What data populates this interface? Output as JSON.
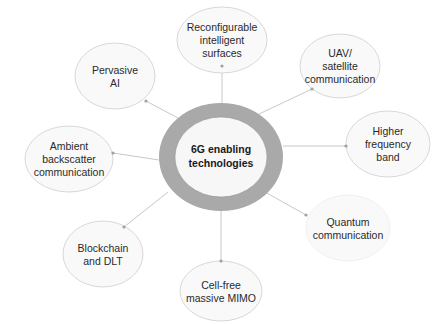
{
  "diagram": {
    "type": "mind-map",
    "center": {
      "lines": [
        "6G enabling",
        "technologies"
      ],
      "ring_color": "#a9a9a9",
      "fill_color": "#f7f7f7"
    },
    "node_style": {
      "fill_color": "#f9f9f9",
      "stroke_color": "#d8d8d8",
      "connector_color": "#c8c8c8",
      "connector_dot_color": "#a0a0a0"
    },
    "nodes": [
      {
        "id": "ris",
        "lines": [
          "Reconfigurable",
          "intelligent",
          "surfaces"
        ]
      },
      {
        "id": "uav",
        "lines": [
          "UAV/",
          "satellite",
          "communication"
        ]
      },
      {
        "id": "hfb",
        "lines": [
          "Higher",
          "frequency",
          "band"
        ]
      },
      {
        "id": "quantum",
        "lines": [
          "Quantum",
          "communication"
        ]
      },
      {
        "id": "cellfree",
        "lines": [
          "Cell-free",
          "massive MIMO"
        ]
      },
      {
        "id": "blockchain",
        "lines": [
          "Blockchain",
          "and DLT"
        ]
      },
      {
        "id": "ambient",
        "lines": [
          "Ambient",
          "backscatter",
          "communication"
        ]
      },
      {
        "id": "pervasive",
        "lines": [
          "Pervasive",
          "AI"
        ]
      }
    ]
  }
}
